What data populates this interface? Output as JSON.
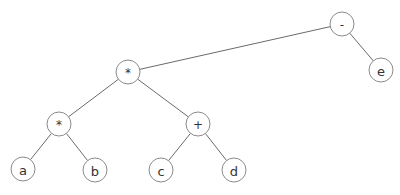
{
  "diagram": {
    "type": "expression-tree",
    "colors": {
      "edge": "#6a6a6a",
      "node_stroke": "#8a8a8a",
      "node_fill": "#ffffff",
      "text": "#333333"
    },
    "node_radius": 12,
    "nodes": [
      {
        "id": "minus",
        "label": "-",
        "x": 342,
        "y": 24
      },
      {
        "id": "mul_top",
        "label": "*",
        "x": 128,
        "y": 72
      },
      {
        "id": "e",
        "label": "e",
        "x": 381,
        "y": 70
      },
      {
        "id": "mul_left",
        "label": "*",
        "x": 59,
        "y": 124
      },
      {
        "id": "plus",
        "label": "+",
        "x": 198,
        "y": 124
      },
      {
        "id": "a",
        "label": "a",
        "x": 23,
        "y": 169
      },
      {
        "id": "b",
        "label": "b",
        "x": 95,
        "y": 170
      },
      {
        "id": "c",
        "label": "c",
        "x": 161,
        "y": 170
      },
      {
        "id": "d",
        "label": "d",
        "x": 234,
        "y": 170
      }
    ],
    "edges": [
      {
        "from": "minus",
        "to": "mul_top"
      },
      {
        "from": "minus",
        "to": "e"
      },
      {
        "from": "mul_top",
        "to": "mul_left"
      },
      {
        "from": "mul_top",
        "to": "plus"
      },
      {
        "from": "mul_left",
        "to": "a"
      },
      {
        "from": "mul_left",
        "to": "b"
      },
      {
        "from": "plus",
        "to": "c"
      },
      {
        "from": "plus",
        "to": "d"
      }
    ]
  }
}
